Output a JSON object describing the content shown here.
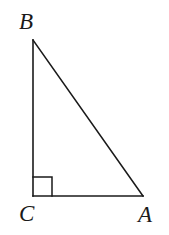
{
  "figure": {
    "kind": "right-triangle-diagram",
    "background_color": "#ffffff",
    "stroke_color": "#1a1a1a",
    "stroke_width": 1.6,
    "labels": {
      "apex": "B",
      "right_angle_vertex": "C",
      "base_right": "A"
    },
    "vertices": {
      "B": {
        "x": 33,
        "y": 40
      },
      "C": {
        "x": 33,
        "y": 196
      },
      "A": {
        "x": 143,
        "y": 196
      }
    },
    "edges": [
      {
        "name": "BC",
        "from": "B",
        "to": "C",
        "role": "vertical-leg"
      },
      {
        "name": "CA",
        "from": "C",
        "to": "A",
        "role": "horizontal-leg"
      },
      {
        "name": "AB",
        "from": "A",
        "to": "B",
        "role": "hypotenuse"
      }
    ],
    "right_angle_marker": {
      "at_vertex": "C",
      "size": 19,
      "x": 33,
      "y": 177,
      "width": 19,
      "height": 19
    }
  }
}
